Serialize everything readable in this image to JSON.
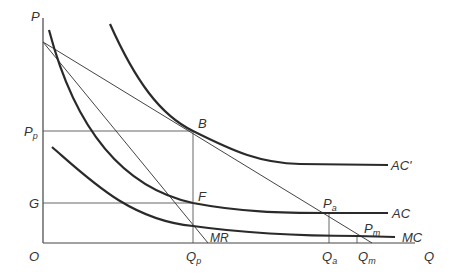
{
  "diagram": {
    "type": "economics-cost-curves",
    "axes": {
      "y_label": "P",
      "x_label": "Q",
      "origin_label": "O"
    },
    "curves": [
      {
        "id": "AC_prime",
        "label": "AC'"
      },
      {
        "id": "AC",
        "label": "AC"
      },
      {
        "id": "MC",
        "label": "MC"
      },
      {
        "id": "MR",
        "label": "MR"
      },
      {
        "id": "demand",
        "label": ""
      }
    ],
    "points": [
      {
        "id": "B",
        "label": "B"
      },
      {
        "id": "F",
        "label": "F"
      },
      {
        "id": "Pa",
        "label": "P",
        "sub": "a"
      },
      {
        "id": "Pm",
        "label": "P",
        "sub": "m"
      }
    ],
    "y_ticks": [
      {
        "id": "Pp",
        "label": "P",
        "sub": "p"
      },
      {
        "id": "G",
        "label": "G"
      }
    ],
    "x_ticks": [
      {
        "id": "Qp",
        "label": "Q",
        "sub": "p"
      },
      {
        "id": "Qa",
        "label": "Q",
        "sub": "a"
      },
      {
        "id": "Qm",
        "label": "Q",
        "sub": "m"
      }
    ]
  }
}
